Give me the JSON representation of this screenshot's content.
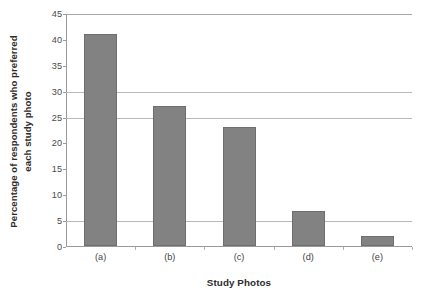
{
  "chart_data": {
    "type": "bar",
    "title": "",
    "subtitle": "",
    "categories": [
      "(a)",
      "(b)",
      "(c)",
      "(d)",
      "(e)"
    ],
    "values": [
      41,
      27,
      23,
      6.7,
      2
    ],
    "xlabel": "Study Photos",
    "ylabel_line1": "Percentage of respondents who preferred",
    "ylabel_line2": "each study photo",
    "ylim": [
      0,
      45
    ],
    "ytick_values": [
      0,
      5,
      10,
      15,
      20,
      25,
      30,
      35,
      40,
      45
    ],
    "ytick_labels": [
      "0",
      "5",
      "10",
      "15",
      "20",
      "25",
      "30",
      "35",
      "40",
      "45"
    ],
    "gridline_values": [
      5,
      25,
      30,
      45
    ],
    "grid": true,
    "legend": false,
    "legend_position": "none",
    "bar_color": "#828282",
    "bar_border_color": "#6e6e6e",
    "grid_color": "#b9b9b9",
    "axis_color": "#9a9a9a",
    "annotations": []
  }
}
